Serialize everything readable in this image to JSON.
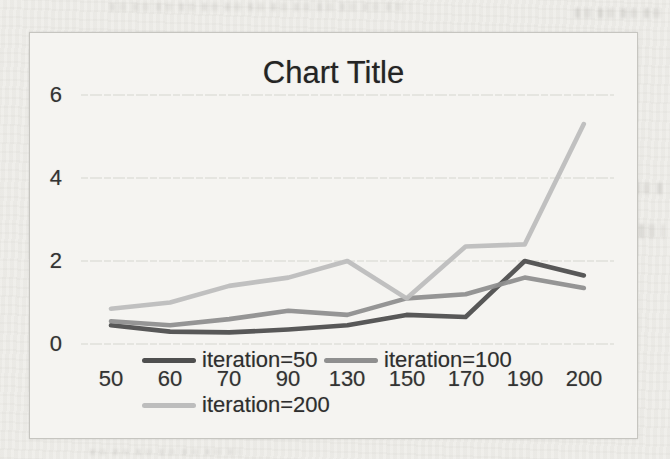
{
  "chart": {
    "title": "Chart Title",
    "y_ticks": [
      "6",
      "4",
      "2",
      "0"
    ],
    "x_labels": [
      "50",
      "60",
      "70",
      "90",
      "130",
      "150",
      "170",
      "190",
      "200"
    ],
    "legend": [
      {
        "label": "iteration=50",
        "color": "#4f4f4f"
      },
      {
        "label": "iteration=100",
        "color": "#8f8f8f"
      },
      {
        "label": "iteration=200",
        "color": "#bdbdbd"
      }
    ]
  },
  "chart_data": {
    "type": "line",
    "title": "Chart Title",
    "categories": [
      50,
      60,
      70,
      90,
      130,
      150,
      170,
      190,
      200
    ],
    "series": [
      {
        "name": "iteration=50",
        "color": "#4f4f4f",
        "values": [
          0.45,
          0.3,
          0.28,
          0.35,
          0.45,
          0.7,
          0.65,
          2.0,
          1.65
        ]
      },
      {
        "name": "iteration=100",
        "color": "#8f8f8f",
        "values": [
          0.55,
          0.45,
          0.6,
          0.8,
          0.7,
          1.1,
          1.2,
          1.6,
          1.35
        ]
      },
      {
        "name": "iteration=200",
        "color": "#bdbdbd",
        "values": [
          0.85,
          1.0,
          1.4,
          1.6,
          2.0,
          1.1,
          2.35,
          2.4,
          5.3
        ]
      }
    ],
    "ylim": [
      0,
      6
    ],
    "y_tick_step": 2,
    "grid": true,
    "gridline_color": "#d6d5d0",
    "legend_position": "bottom-overlapping-x-axis",
    "xlabel": "",
    "ylabel": ""
  }
}
